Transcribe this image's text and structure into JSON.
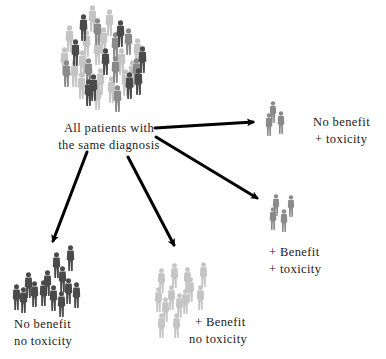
{
  "diagram": {
    "type": "patient stratification diagram",
    "source_node": {
      "label_lines": [
        "All patients with",
        "the same diagnosis"
      ],
      "crowd": "mixed light/medium/dark patient icons"
    },
    "outcomes": [
      {
        "id": "no-benefit-toxicity",
        "label_lines": [
          "No benefit",
          "+ toxicity"
        ],
        "figure_count": 3,
        "figure_shade": "medium"
      },
      {
        "id": "benefit-toxicity",
        "label_lines": [
          "+ Benefit",
          "+ toxicity"
        ],
        "figure_count": 4,
        "figure_shade": "medium"
      },
      {
        "id": "benefit-no-toxicity",
        "label_lines": [
          "+ Benefit",
          "no toxicity"
        ],
        "figure_count": 14,
        "figure_shade": "light"
      },
      {
        "id": "no-benefit-no-toxicity",
        "label_lines": [
          "No benefit",
          "no toxicity"
        ],
        "figure_count": 14,
        "figure_shade": "dark"
      }
    ],
    "colors": {
      "light_figure": "#c4c4c4",
      "medium_figure": "#8a8a8a",
      "dark_figure": "#4a4a4a",
      "arrow": "#000000",
      "text": "#222222"
    }
  }
}
